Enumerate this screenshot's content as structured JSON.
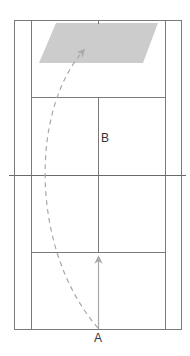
{
  "diagram": {
    "type": "badminton-court-shot-diagram",
    "labels": {
      "player_a": "A",
      "point_b": "B"
    },
    "colors": {
      "court_lines": "#7a7a7a",
      "target_zone": "#cccccc",
      "arrows": "#a9a9a9",
      "text": "#333333",
      "background": "#ffffff"
    },
    "elements": {
      "target_zone": "rear-court target area (shaded parallelogram)",
      "dashed_arrow": "high clear trajectory from A to rear court",
      "solid_arrow": "straight path from A toward short service line"
    }
  }
}
